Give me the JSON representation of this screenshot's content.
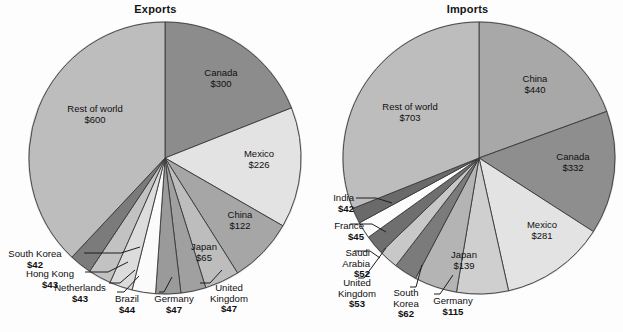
{
  "figure": {
    "background": "#fdfdfd",
    "width": 623,
    "height": 332
  },
  "chart_data": [
    {
      "type": "pie",
      "title": "Exports",
      "units": "billions of US dollars",
      "categories": [
        "Canada",
        "Mexico",
        "China",
        "Japan",
        "United Kingdom",
        "Germany",
        "Brazil",
        "Netherlands",
        "Hong Kong",
        "South Korea",
        "Rest of world"
      ],
      "values": [
        300,
        226,
        122,
        65,
        47,
        47,
        44,
        43,
        43,
        42,
        600
      ],
      "labels": [
        "$300",
        "$226",
        "$122",
        "$65",
        "$47",
        "$47",
        "$44",
        "$43",
        "$43",
        "$42",
        "$600"
      ],
      "colors": [
        "#8c8c8c",
        "#e3e3e3",
        "#a6a6a6",
        "#bdbdbd",
        "#a0a0a0",
        "#9a9a9a",
        "#fbfbfb",
        "#dcdcdc",
        "#c2c2c2",
        "#7b7b7b",
        "#bdbdbd"
      ],
      "start_angle_deg": 0,
      "direction": "clockwise",
      "legend": "none",
      "grid": false
    },
    {
      "type": "pie",
      "title": "Imports",
      "units": "billions of US dollars",
      "categories": [
        "China",
        "Canada",
        "Mexico",
        "Japan",
        "Germany",
        "South Korea",
        "United Kingdom",
        "Saudi Arabia",
        "France",
        "India",
        "Rest of world"
      ],
      "values": [
        440,
        332,
        281,
        139,
        115,
        62,
        53,
        52,
        45,
        42,
        703
      ],
      "labels": [
        "$440",
        "$332",
        "$281",
        "$139",
        "$115",
        "$62",
        "$53",
        "$52",
        "$45",
        "$42",
        "$703"
      ],
      "colors": [
        "#a8a8a8",
        "#8e8e8e",
        "#e3e3e3",
        "#cfcfcf",
        "#b4b4b4",
        "#7b7b7b",
        "#c8c8c8",
        "#6f6f6f",
        "#fcfcfc",
        "#6a6a6a",
        "#bdbdbd"
      ],
      "start_angle_deg": 0,
      "direction": "clockwise",
      "legend": "none",
      "grid": false
    }
  ],
  "exports": {
    "title": "Exports",
    "inside_labels": [
      {
        "name": "Canada",
        "value": "$300"
      },
      {
        "name": "Mexico",
        "value": "$226"
      },
      {
        "name": "China",
        "value": "$122"
      },
      {
        "name": "Japan",
        "value": "$65"
      },
      {
        "name": "Rest of world",
        "value": "$600"
      }
    ],
    "outside_labels": [
      {
        "name": "United",
        "name2": "Kingdom",
        "value": "$47"
      },
      {
        "name": "Germany",
        "value": "$47"
      },
      {
        "name": "Brazil",
        "value": "$44"
      },
      {
        "name": "Netherlands",
        "value": "$43"
      },
      {
        "name": "Hong Kong",
        "value": "$43"
      },
      {
        "name": "South Korea",
        "value": "$42"
      }
    ]
  },
  "imports": {
    "title": "Imports",
    "inside_labels": [
      {
        "name": "China",
        "value": "$440"
      },
      {
        "name": "Canada",
        "value": "$332"
      },
      {
        "name": "Mexico",
        "value": "$281"
      },
      {
        "name": "Japan",
        "value": "$139"
      },
      {
        "name": "Rest of world",
        "value": "$703"
      }
    ],
    "outside_labels": [
      {
        "name": "Germany",
        "value": "$115"
      },
      {
        "name": "South",
        "name2": "Korea",
        "value": "$62"
      },
      {
        "name": "United",
        "name2": "Kingdom",
        "value": "$53"
      },
      {
        "name": "Saudi",
        "name2": "Arabia",
        "value": "$52"
      },
      {
        "name": "France",
        "value": "$45"
      },
      {
        "name": "India",
        "value": "$42"
      }
    ]
  }
}
